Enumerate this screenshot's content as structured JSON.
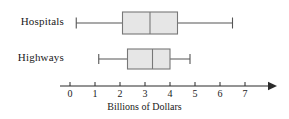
{
  "chart_data": {
    "type": "box",
    "title": "",
    "xlabel": "Billions of Dollars",
    "ylabel": "",
    "orientation": "horizontal",
    "xlim": [
      -0.3,
      8.2
    ],
    "grid": false,
    "legend": "none",
    "axis": {
      "ticks": [
        0,
        1,
        2,
        3,
        4,
        5,
        6,
        7
      ],
      "tick_labels": [
        "0",
        "1",
        "2",
        "3",
        "4",
        "5",
        "6",
        "7"
      ],
      "arrow_end": true
    },
    "categories": [
      "Hospitals",
      "Highways"
    ],
    "series": [
      {
        "name": "Hospitals",
        "min": 0.25,
        "q1": 2.1,
        "median": 3.2,
        "q3": 4.3,
        "max": 6.5
      },
      {
        "name": "Highways",
        "min": 1.15,
        "q1": 2.3,
        "median": 3.3,
        "q3": 4.0,
        "max": 4.8
      }
    ]
  },
  "labels": {
    "hospitals": "Hospitals",
    "highways": "Highways",
    "axis_title": "Billions of Dollars"
  },
  "ticks": {
    "t0": "0",
    "t1": "1",
    "t2": "2",
    "t3": "3",
    "t4": "4",
    "t5": "5",
    "t6": "6",
    "t7": "7"
  },
  "colors": {
    "box_fill": "#e6e6e6",
    "box_stroke": "#777777",
    "whisker": "#555555",
    "axis": "#2b2b2b",
    "text": "#1a1a1a"
  }
}
